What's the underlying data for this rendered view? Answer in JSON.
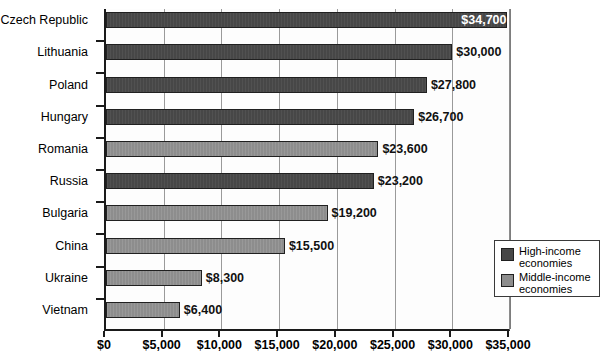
{
  "chart_data": {
    "type": "bar",
    "orientation": "horizontal",
    "title": "",
    "xlabel": "",
    "ylabel": "",
    "xlim": [
      0,
      35000
    ],
    "xticks": [
      0,
      5000,
      10000,
      15000,
      20000,
      25000,
      30000,
      35000
    ],
    "xtick_labels": [
      "$0",
      "$5,000",
      "$10,000",
      "$15,000",
      "$20,000",
      "$25,000",
      "$30,000",
      "$35,000"
    ],
    "grid": true,
    "grid_axis": "x",
    "legend_position": "inside-right-lower",
    "categories": [
      "Czech Republic",
      "Lithuania",
      "Poland",
      "Hungary",
      "Romania",
      "Russia",
      "Bulgaria",
      "China",
      "Ukraine",
      "Vietnam"
    ],
    "values": [
      34700,
      30000,
      27800,
      26700,
      23600,
      23200,
      19200,
      15500,
      8300,
      6400
    ],
    "value_labels": [
      "$34,700",
      "$30,000",
      "$27,800",
      "$26,700",
      "$23,600",
      "$23,200",
      "$19,200",
      "$15,500",
      "$8,300",
      "$6,400"
    ],
    "groups": [
      "high",
      "high",
      "high",
      "high",
      "middle",
      "high",
      "middle",
      "middle",
      "middle",
      "middle"
    ],
    "label_placement": [
      "inside",
      "outside",
      "outside",
      "outside",
      "outside",
      "outside",
      "outside",
      "outside",
      "outside",
      "outside"
    ],
    "series": [
      {
        "name": "High-income economies",
        "color": "#474747",
        "points": [
          {
            "category": "Czech Republic",
            "value": 34700
          },
          {
            "category": "Lithuania",
            "value": 30000
          },
          {
            "category": "Poland",
            "value": 27800
          },
          {
            "category": "Hungary",
            "value": 26700
          },
          {
            "category": "Russia",
            "value": 23200
          }
        ]
      },
      {
        "name": "Middle-income economies",
        "color": "#8d8d8d",
        "points": [
          {
            "category": "Romania",
            "value": 23600
          },
          {
            "category": "Bulgaria",
            "value": 19200
          },
          {
            "category": "China",
            "value": 15500
          },
          {
            "category": "Ukraine",
            "value": 8300
          },
          {
            "category": "Vietnam",
            "value": 6400
          }
        ]
      }
    ]
  },
  "legend": {
    "items": [
      {
        "label": "High-income\neconomies",
        "color": "#474747",
        "key": "high"
      },
      {
        "label": "Middle-income\neconomies",
        "color": "#8d8d8d",
        "key": "middle"
      }
    ]
  },
  "colors": {
    "high_income": "#474747",
    "middle_income": "#8d8d8d",
    "axis": "#1a1a1a",
    "gridline": "#9a9a9a",
    "plot_background": "#fdfdfd",
    "page_background": "#ffffff"
  }
}
